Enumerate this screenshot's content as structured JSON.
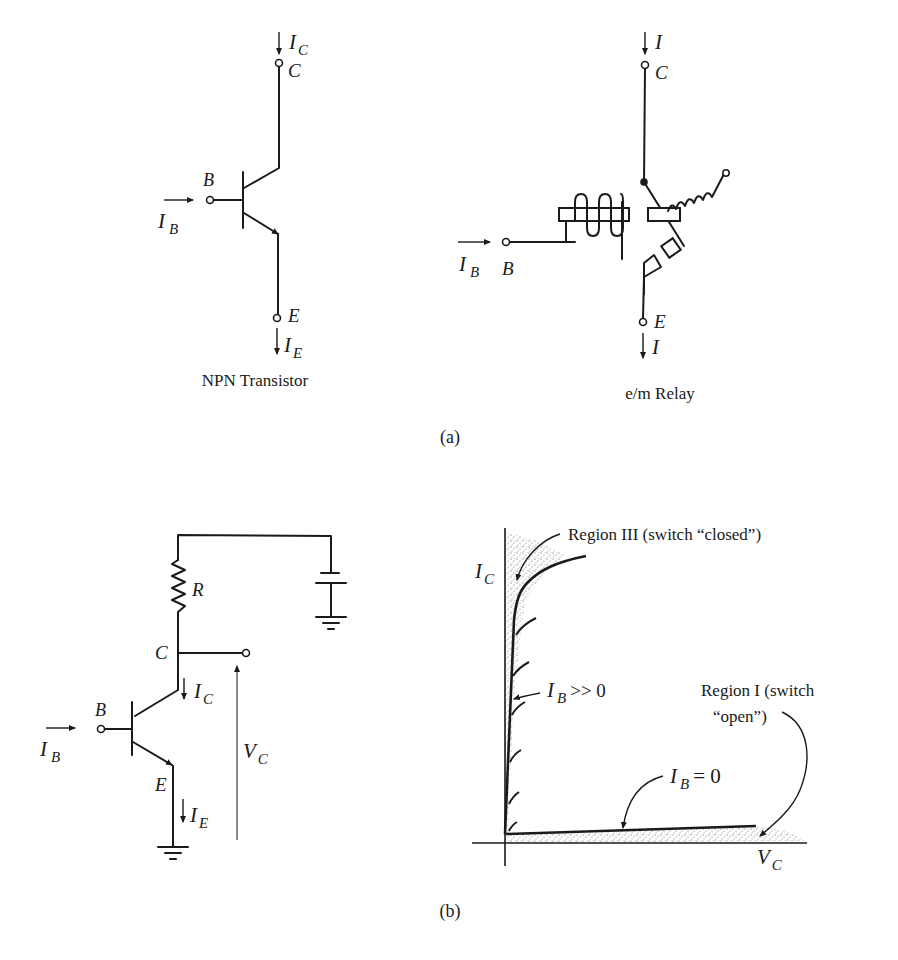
{
  "page": {
    "corner_mark": ""
  },
  "part_a": {
    "caption": "(a)",
    "transistor": {
      "title": "NPN Transistor",
      "collector_current": "I",
      "collector_current_sub": "C",
      "collector_label": "C",
      "base_label": "B",
      "base_current": "I",
      "base_current_sub": "B",
      "emitter_label": "E",
      "emitter_current": "I",
      "emitter_current_sub": "E"
    },
    "relay": {
      "title": "e/m  Relay",
      "collector_current": "I",
      "collector_label": "C",
      "base_label": "B",
      "base_current": "I",
      "base_current_sub": "B",
      "emitter_label": "E",
      "emitter_current": "I"
    }
  },
  "part_b": {
    "caption": "(b)",
    "circuit": {
      "resistor_label": "R",
      "collector_label": "C",
      "collector_current": "I",
      "collector_current_sub": "C",
      "base_label": "B",
      "base_current": "I",
      "base_current_sub": "B",
      "emitter_label": "E",
      "emitter_current": "I",
      "emitter_current_sub": "E",
      "voltage_label": "V",
      "voltage_label_sub": "C"
    },
    "graph": {
      "y_axis_label": "I",
      "y_axis_label_sub": "C",
      "x_axis_label": "V",
      "x_axis_label_sub": "C",
      "region3_label": "Region III  (switch “closed”)",
      "region1_label_line1": "Region I  (switch",
      "region1_label_line2": "“open”)",
      "ib_high_label": "I",
      "ib_high_sub": "B",
      "ib_high_rel": ">> 0",
      "ib_zero_label": "I",
      "ib_zero_sub": "B",
      "ib_zero_rel": "= 0"
    }
  }
}
